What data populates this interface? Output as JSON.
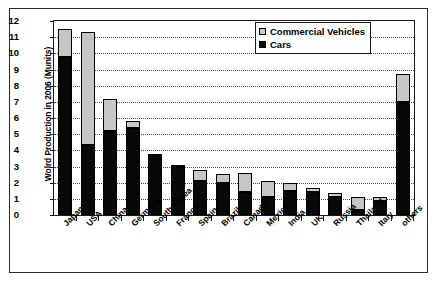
{
  "chart_data": {
    "type": "bar",
    "stacked": true,
    "title": "",
    "xlabel": "",
    "ylabel": "Wolrd Production in 2006 (Munits)",
    "ylim": [
      0,
      12
    ],
    "ytick_step": 1,
    "yticks": [
      "0",
      "1",
      "2",
      "3",
      "4",
      "5",
      "6",
      "7",
      "8",
      "9",
      "10",
      "11",
      "12"
    ],
    "grid": true,
    "grid_style": "dotted-horizontal",
    "legend_position": "top-right",
    "categories": [
      "Japan",
      "USA",
      "China",
      "Germany",
      "South Korea",
      "France",
      "Spain",
      "Brazil",
      "Canada",
      "Mexico",
      "India",
      "UK",
      "Russia",
      "Thailand",
      "Italy",
      "others"
    ],
    "series": [
      {
        "name": "Cars",
        "color": "#080808",
        "values": [
          9.8,
          4.35,
          5.2,
          5.4,
          3.65,
          2.95,
          2.1,
          2.0,
          1.4,
          1.1,
          1.5,
          1.45,
          1.1,
          0.3,
          0.85,
          7.0
        ]
      },
      {
        "name": "Commercial Vehicles",
        "color": "#c6c6c6",
        "values": [
          1.7,
          6.95,
          2.0,
          0.4,
          0.15,
          0.15,
          0.7,
          0.55,
          1.2,
          1.0,
          0.45,
          0.2,
          0.25,
          0.8,
          0.25,
          1.7
        ]
      }
    ],
    "totals": [
      11.5,
      11.3,
      7.2,
      5.8,
      3.8,
      3.1,
      2.8,
      2.55,
      2.6,
      2.1,
      1.95,
      1.65,
      1.35,
      1.1,
      1.1,
      8.7
    ]
  },
  "legend": {
    "items": [
      {
        "label": "Commercial Vehicles",
        "swatch": "commercial-vehicles-swatch"
      },
      {
        "label": "Cars",
        "swatch": "cars-swatch"
      }
    ]
  }
}
